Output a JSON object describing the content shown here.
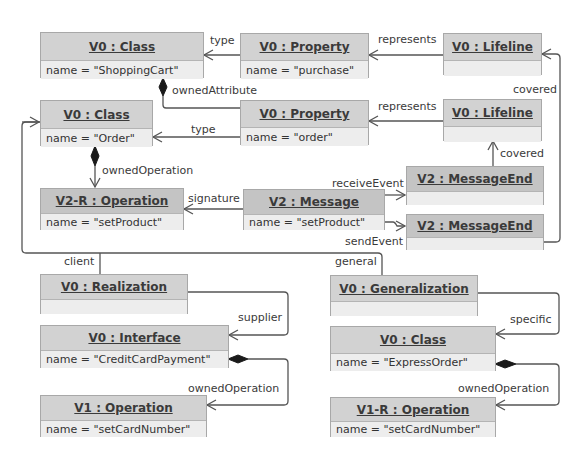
{
  "objects": {
    "class_shoppingcart": {
      "title": "V0 : Class",
      "attr": "name = \"ShoppingCart\""
    },
    "class_order": {
      "title": "V0 : Class",
      "attr": "name = \"Order\""
    },
    "property_purchase": {
      "title": "V0 : Property",
      "attr": "name = \"purchase\""
    },
    "property_order": {
      "title": "V0 : Property",
      "attr": "name = \"order\""
    },
    "lifeline_1": {
      "title": "V0 : Lifeline",
      "attr": ""
    },
    "lifeline_2": {
      "title": "V0 : Lifeline",
      "attr": ""
    },
    "operation_setproduct": {
      "title": "V2-R : Operation",
      "attr": "name = \"setProduct\""
    },
    "message_setproduct": {
      "title": "V2 : Message",
      "attr": "name = \"setProduct\""
    },
    "messageend_receive": {
      "title": "V2 : MessageEnd",
      "attr": ""
    },
    "messageend_send": {
      "title": "V2 : MessageEnd",
      "attr": ""
    },
    "realization": {
      "title": "V0 : Realization",
      "attr": ""
    },
    "interface_creditcard": {
      "title": "V0 : Interface",
      "attr": "name = \"CreditCardPayment\""
    },
    "operation_setcardnumber_v1": {
      "title": "V1 : Operation",
      "attr": "name = \"setCardNumber\""
    },
    "generalization": {
      "title": "V0 : Generalization",
      "attr": ""
    },
    "class_expressorder": {
      "title": "V0 : Class",
      "attr": "name = \"ExpressOrder\""
    },
    "operation_setcardnumber_v1r": {
      "title": "V1-R : Operation",
      "attr": "name = \"setCardNumber\""
    }
  },
  "links": {
    "type_1": "type",
    "type_2": "type",
    "owned_attribute": "ownedAttribute",
    "represents_1": "represents",
    "represents_2": "represents",
    "covered_1": "covered",
    "covered_2": "covered",
    "owned_operation_1": "ownedOperation",
    "signature": "signature",
    "receive_event": "receiveEvent",
    "send_event": "sendEvent",
    "client": "client",
    "general": "general",
    "supplier": "supplier",
    "owned_operation_2": "ownedOperation",
    "specific": "specific",
    "owned_operation_3": "ownedOperation"
  }
}
